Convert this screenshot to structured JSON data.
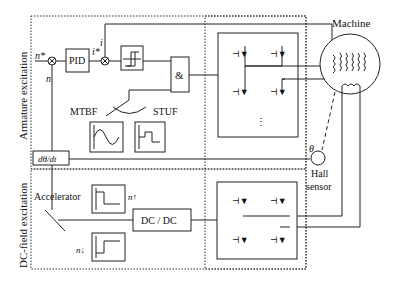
{
  "diagram": {
    "sections": {
      "armature": "Armature excitation",
      "dcfield": "DC-field excitation"
    },
    "blocks": {
      "pid": "PID",
      "and": "&",
      "derivative": "dθ/dt",
      "dcdc": "DC / DC",
      "machine": "Machine",
      "hall_line1": "Hall",
      "hall_line2": "sensor",
      "accelerator": "Accelerator"
    },
    "signals": {
      "n_star": "n*",
      "n": "n",
      "i": "i",
      "i_star": "i*",
      "theta": "θ",
      "n_up": "n↑",
      "n_down": "n↓",
      "plus": "+",
      "minus": "−"
    },
    "modes": {
      "left": "MTBF",
      "right": "STUF"
    }
  }
}
